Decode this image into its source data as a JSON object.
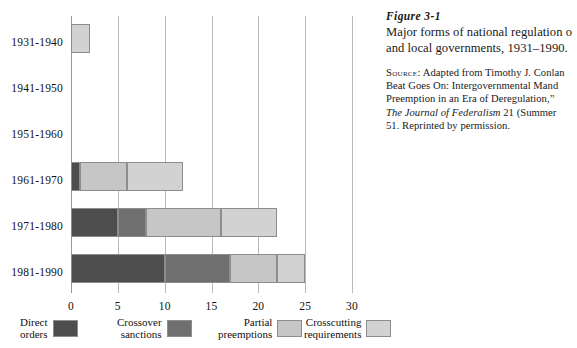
{
  "chart_data": {
    "type": "bar",
    "orientation": "horizontal",
    "stacked": true,
    "xlabel": "",
    "ylabel": "",
    "xlim": [
      0,
      30
    ],
    "xticks": [
      "0",
      "5",
      "10",
      "15",
      "20",
      "25",
      "30"
    ],
    "xtick_values": [
      0,
      5,
      10,
      15,
      20,
      25,
      30
    ],
    "grid": "vertical",
    "legend_position": "bottom",
    "categories": [
      "1931-1940",
      "1941-1950",
      "1951-1960",
      "1961-1970",
      "1971-1980",
      "1981-1990"
    ],
    "series": [
      {
        "name": "Direct orders",
        "color": "#4d4d4d",
        "values": [
          0,
          0,
          0,
          1,
          5,
          10
        ]
      },
      {
        "name": "Crossover sanctions",
        "color": "#6f6f6f",
        "values": [
          0,
          0,
          0,
          0,
          3,
          7
        ]
      },
      {
        "name": "Partial preemptions",
        "color": "#c6c6c6",
        "values": [
          0,
          0,
          0,
          5,
          8,
          5
        ]
      },
      {
        "name": "Crosscutting requirements",
        "color": "#d2d2d2",
        "values": [
          2,
          0,
          0,
          6,
          6,
          3
        ]
      }
    ],
    "totals": [
      2,
      0,
      0,
      12,
      22,
      25
    ]
  },
  "legend": {
    "items": [
      {
        "label_line1": "Direct",
        "label_line2": "orders",
        "color": "#4d4d4d"
      },
      {
        "label_line1": "Crossover",
        "label_line2": "sanctions",
        "color": "#6f6f6f"
      },
      {
        "label_line1": "Partial",
        "label_line2": "preemptions",
        "color": "#c6c6c6"
      },
      {
        "label_line1": "Crosscutting",
        "label_line2": "requirements",
        "color": "#d2d2d2"
      }
    ]
  },
  "caption": {
    "figure_number": "Figure 3-1",
    "title_line1": "Major forms of national regulation o",
    "title_line2": "and local governments, 1931–1990.",
    "source_label": "Source:",
    "source_line1": " Adapted from Timothy J. Conlan",
    "source_line2": "Beat Goes On: Intergovernmental Mand",
    "source_line3": "Preemption in an Era of Deregulation,”",
    "source_line4_italic": "The Journal of Federalism",
    "source_line4_rest": " 21 (Summer",
    "source_line5": "51. Reprinted by permission."
  },
  "colors": {
    "gridline": "#b9b9b9",
    "axis": "#9a9a9a",
    "bar_border": "#8d8d8d",
    "text": "#111111",
    "background": "#ffffff"
  }
}
